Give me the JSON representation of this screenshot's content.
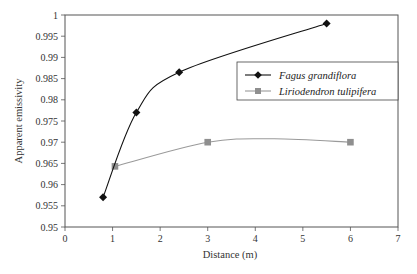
{
  "chart_data": {
    "type": "line",
    "title": "",
    "xlabel": "Distance (m)",
    "ylabel": "Apparent emissivity",
    "xlim": [
      0,
      7
    ],
    "ylim": [
      0.95,
      1
    ],
    "x_ticks": [
      0,
      1,
      2,
      3,
      4,
      5,
      6,
      7
    ],
    "x_tick_labels": [
      "0",
      "1",
      "2",
      "3",
      "4",
      "5",
      "6",
      "7"
    ],
    "y_ticks": [
      0.95,
      0.955,
      0.96,
      0.965,
      0.97,
      0.975,
      0.98,
      0.985,
      0.99,
      0.995,
      1
    ],
    "y_tick_labels": [
      "0.95",
      "0.955",
      "0.96",
      "0.965",
      "0.97",
      "0.975",
      "0.98",
      "0.985",
      "0.99",
      "0.995",
      "1"
    ],
    "grid": false,
    "legend_position": "upper right (inside plot)",
    "series": [
      {
        "name": "Fagus grandiflora",
        "marker": "diamond",
        "color": "#111111",
        "x": [
          0.8,
          1.5,
          2.4,
          5.5
        ],
        "y": [
          0.957,
          0.977,
          0.9865,
          0.998
        ]
      },
      {
        "name": "Liriodendron tulipifera",
        "marker": "square",
        "color": "#9a9a9a",
        "x": [
          1.05,
          3.0,
          6.0
        ],
        "y": [
          0.9643,
          0.97,
          0.97
        ]
      }
    ]
  },
  "legend": {
    "items": [
      {
        "label": "Fagus grandiflora"
      },
      {
        "label": "Liriodendron tulipifera"
      }
    ]
  },
  "axes": {
    "xlabel": "Distance (m)",
    "ylabel": "Apparent emissivity"
  }
}
